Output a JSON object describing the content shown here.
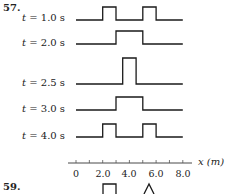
{
  "problem_57": {
    "number": "57.",
    "x_axis": {
      "label": "x (m)",
      "ticks": [
        "0",
        "2.0",
        "4.0",
        "6.0",
        "8.0"
      ],
      "range": [
        0,
        8
      ]
    },
    "rows": [
      {
        "t_label": "t = 1.0 s",
        "t_var": "t",
        "t_text": " = 1.0 s",
        "pulses": [
          [
            2,
            3,
            1
          ],
          [
            5,
            6,
            1
          ]
        ]
      },
      {
        "t_label": "t = 2.0 s",
        "t_var": "t",
        "t_text": " = 2.0 s",
        "pulses": [
          [
            3,
            5,
            1
          ]
        ]
      },
      {
        "t_label": "t = 2.5 s",
        "t_var": "t",
        "t_text": " = 2.5 s",
        "pulses": [
          [
            3.5,
            4.5,
            2
          ]
        ]
      },
      {
        "t_label": "t = 3.0 s",
        "t_var": "t",
        "t_text": " = 3.0 s",
        "pulses": [
          [
            3,
            5,
            1
          ]
        ]
      },
      {
        "t_label": "t = 4.0 s",
        "t_var": "t",
        "t_text": " = 4.0 s",
        "pulses": [
          [
            2,
            3,
            1
          ],
          [
            5,
            6,
            1
          ]
        ]
      }
    ]
  },
  "problem_59": {
    "number": "59.",
    "t_label_partial": "t = 1.0"
  },
  "chart_data": {
    "type": "line",
    "xlabel": "x (m)",
    "ylabel": "",
    "xlim": [
      0,
      8
    ],
    "x_ticks": [
      0,
      2.0,
      4.0,
      6.0,
      8.0
    ],
    "grid": false,
    "series": [
      {
        "name": "t = 1.0 s",
        "x": [
          0,
          2,
          2,
          3,
          3,
          5,
          5,
          6,
          6,
          8
        ],
        "y": [
          0,
          0,
          1,
          1,
          0,
          0,
          1,
          1,
          0,
          0
        ]
      },
      {
        "name": "t = 2.0 s",
        "x": [
          0,
          3,
          3,
          5,
          5,
          8
        ],
        "y": [
          0,
          0,
          1,
          1,
          0,
          0
        ]
      },
      {
        "name": "t = 2.5 s",
        "x": [
          0,
          3.5,
          3.5,
          4.5,
          4.5,
          8
        ],
        "y": [
          0,
          0,
          2,
          2,
          0,
          0
        ]
      },
      {
        "name": "t = 3.0 s",
        "x": [
          0,
          3,
          3,
          5,
          5,
          8
        ],
        "y": [
          0,
          0,
          1,
          1,
          0,
          0
        ]
      },
      {
        "name": "t = 4.0 s",
        "x": [
          0,
          2,
          2,
          3,
          3,
          5,
          5,
          6,
          6,
          8
        ],
        "y": [
          0,
          0,
          1,
          1,
          0,
          0,
          1,
          1,
          0,
          0
        ]
      }
    ]
  }
}
